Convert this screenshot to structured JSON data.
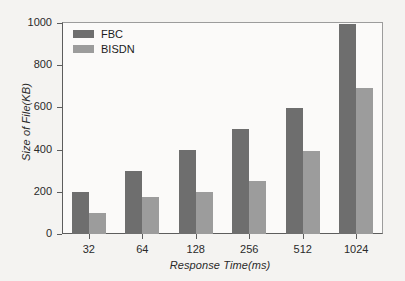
{
  "chart_data": {
    "type": "bar",
    "title": "",
    "subtitle": "",
    "xlabel": "Response Time(ms)",
    "ylabel": "Size of File(KB)",
    "categories": [
      "32",
      "64",
      "128",
      "256",
      "512",
      "1024"
    ],
    "series": [
      {
        "name": "FBC",
        "color": "#6e6e6e",
        "values": [
          200,
          300,
          400,
          500,
          595,
          995
        ]
      },
      {
        "name": "BISDN",
        "color": "#9c9c9c",
        "values": [
          100,
          175,
          200,
          250,
          395,
          690
        ]
      }
    ],
    "ylim": [
      0,
      1000
    ],
    "yticks": [
      0,
      200,
      400,
      600,
      800,
      1000
    ],
    "ytick_labels": [
      "0",
      "200",
      "400",
      "600",
      "800",
      "1000"
    ],
    "grid": false,
    "legend_position": "top-left",
    "background_color": "#f4f3f1",
    "axis_color": "#5d5d5d"
  },
  "legend": {
    "entries": [
      {
        "label": "FBC"
      },
      {
        "label": "BISDN"
      }
    ]
  }
}
